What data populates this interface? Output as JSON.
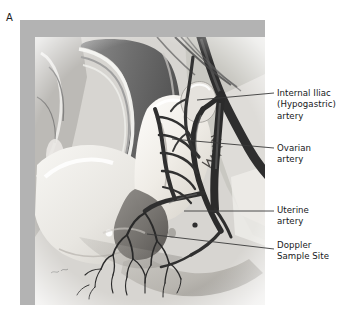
{
  "figure": {
    "panel_letter": "A",
    "type": "medical-illustration",
    "background_color": "#ffffff",
    "frame_color": "#b3b3b3",
    "label_color": "#16181a",
    "leader_line_color": "#3a3a3a"
  },
  "callouts": [
    {
      "id": "internal-iliac-artery",
      "text": "Internal Iliac\n(Hypogastric)\nartery",
      "line": {
        "x1": 197,
        "y1": 100,
        "x2": 274,
        "y2": 93
      }
    },
    {
      "id": "ovarian-artery",
      "text": "Ovarian\nartery",
      "line": {
        "x1": 172,
        "y1": 139,
        "x2": 274,
        "y2": 148
      }
    },
    {
      "id": "uterine-artery",
      "text": "Uterine\nartery",
      "line": {
        "x1": 184,
        "y1": 211,
        "x2": 274,
        "y2": 211
      }
    },
    {
      "id": "doppler-sample-site",
      "text": "Doppler\nSample Site",
      "line": {
        "x1": 147,
        "y1": 234,
        "x2": 274,
        "y2": 249
      }
    }
  ],
  "anatomy_legend": [
    "bladder",
    "uterus",
    "ovary",
    "vagina",
    "rectum",
    "common iliac artery",
    "external iliac artery",
    "internal iliac (hypogastric) artery",
    "ovarian artery",
    "uterine artery",
    "arcuate arteries",
    "radial arteries"
  ]
}
